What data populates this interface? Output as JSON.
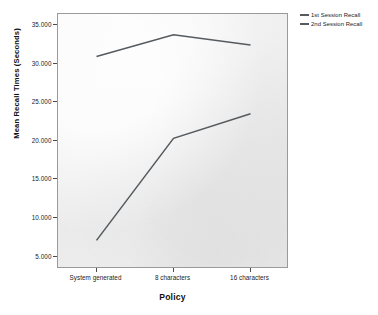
{
  "chart_data": {
    "type": "line",
    "title": "",
    "xlabel": "Policy",
    "ylabel": "Mean Recall Times (Seconds)",
    "categories": [
      "System generated",
      "8 characters",
      "16 characters"
    ],
    "series": [
      {
        "name": "1st Session Recall",
        "values": [
          7.2,
          20.4,
          23.6
        ],
        "color": "#555a5e"
      },
      {
        "name": "2nd Session Recall",
        "values": [
          31.0,
          33.8,
          32.5
        ],
        "color": "#555a5e"
      }
    ],
    "ylim": [
      3.5,
      36.5
    ],
    "yticks": [
      5,
      10,
      15,
      20,
      25,
      30,
      35
    ],
    "ytick_labels": [
      "5.000",
      "10.000",
      "15.000",
      "20.000",
      "25.000",
      "30.000",
      "35.000"
    ],
    "grid": false,
    "legend_position": "top-right",
    "plot_background": "#f1f1f1",
    "frame_color": "#9a9a9a"
  },
  "axes": {
    "y": {
      "title": "Mean Recall Times (Seconds)",
      "ticks": [
        {
          "value": 35,
          "label": "35.000"
        },
        {
          "value": 30,
          "label": "30.000"
        },
        {
          "value": 25,
          "label": "25.000"
        },
        {
          "value": 20,
          "label": "20.000"
        },
        {
          "value": 15,
          "label": "15.000"
        },
        {
          "value": 10,
          "label": "10.000"
        },
        {
          "value": 5,
          "label": "5.000"
        }
      ]
    },
    "x": {
      "title": "Policy",
      "ticks": [
        {
          "label": "System generated"
        },
        {
          "label": "8 characters"
        },
        {
          "label": "16 characters"
        }
      ]
    }
  },
  "legend": {
    "items": [
      {
        "label": "1st Session Recall",
        "color": "#555a5e"
      },
      {
        "label": "2nd Session Recall",
        "color": "#555a5e"
      }
    ]
  }
}
